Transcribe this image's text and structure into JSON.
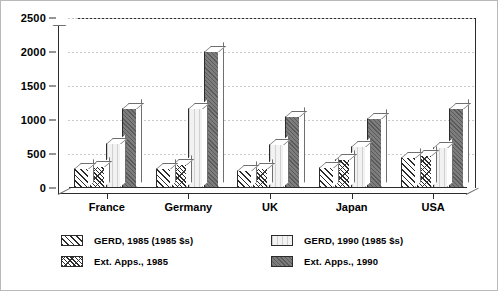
{
  "chart_data": {
    "type": "bar",
    "title": "",
    "xlabel": "",
    "ylabel": "",
    "ylim": [
      0,
      2500
    ],
    "yticks": [
      0,
      500,
      1000,
      1500,
      2000,
      2500
    ],
    "grid": true,
    "legend_position": "bottom",
    "style": "3d-grouped-bar",
    "categories": [
      "France",
      "Germany",
      "UK",
      "Japan",
      "USA"
    ],
    "series": [
      {
        "name": "GERD, 1985 (1985 $s)",
        "pattern": "diagonal-hatch",
        "color": "#ffffff",
        "values": [
          300,
          300,
          260,
          310,
          460
        ]
      },
      {
        "name": "Ext. Apps., 1985",
        "pattern": "dense-cross-hatch",
        "color": "#ffffff",
        "values": [
          320,
          350,
          290,
          420,
          480
        ]
      },
      {
        "name": "GERD, 1990 (1985 $s)",
        "pattern": "light-vertical-lines",
        "color": "#f2f2f2",
        "values": [
          660,
          1180,
          650,
          620,
          610
        ]
      },
      {
        "name": "Ext. Apps., 1990",
        "pattern": "solid-dark-gray",
        "color": "#7d7d7d",
        "values": [
          1170,
          2010,
          1060,
          1030,
          1170
        ]
      }
    ]
  },
  "legend": {
    "items": [
      {
        "label": "GERD, 1985 (1985 $s)"
      },
      {
        "label": "Ext. Apps., 1985"
      },
      {
        "label": "GERD, 1990 (1985 $s)"
      },
      {
        "label": "Ext. Apps., 1990"
      }
    ]
  }
}
